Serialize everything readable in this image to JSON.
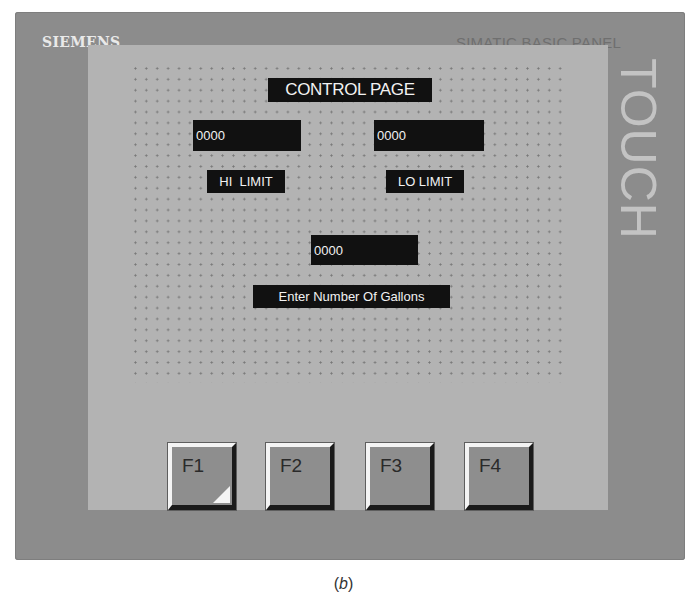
{
  "device": {
    "brand": "SIEMENS",
    "model": "SIMATIC BASIC PANEL",
    "side_label": "TOUCH",
    "colors": {
      "bezel": "#8c8c8c",
      "screen": "#b3b3b3",
      "field": "#111111",
      "text": "#f2f2f2"
    }
  },
  "screen": {
    "title": "CONTROL PAGE",
    "hi_limit": {
      "value": "0000",
      "label": "HI  LIMIT"
    },
    "lo_limit": {
      "value": "0000",
      "label": "LO LIMIT"
    },
    "gallons": {
      "value": "0000",
      "label": "Enter Number Of Gallons"
    }
  },
  "function_keys": [
    {
      "label": "F1",
      "corner_mark": true
    },
    {
      "label": "F2",
      "corner_mark": false
    },
    {
      "label": "F3",
      "corner_mark": false
    },
    {
      "label": "F4",
      "corner_mark": false
    }
  ],
  "caption": {
    "prefix": "(",
    "letter": "b",
    "suffix": ")"
  }
}
